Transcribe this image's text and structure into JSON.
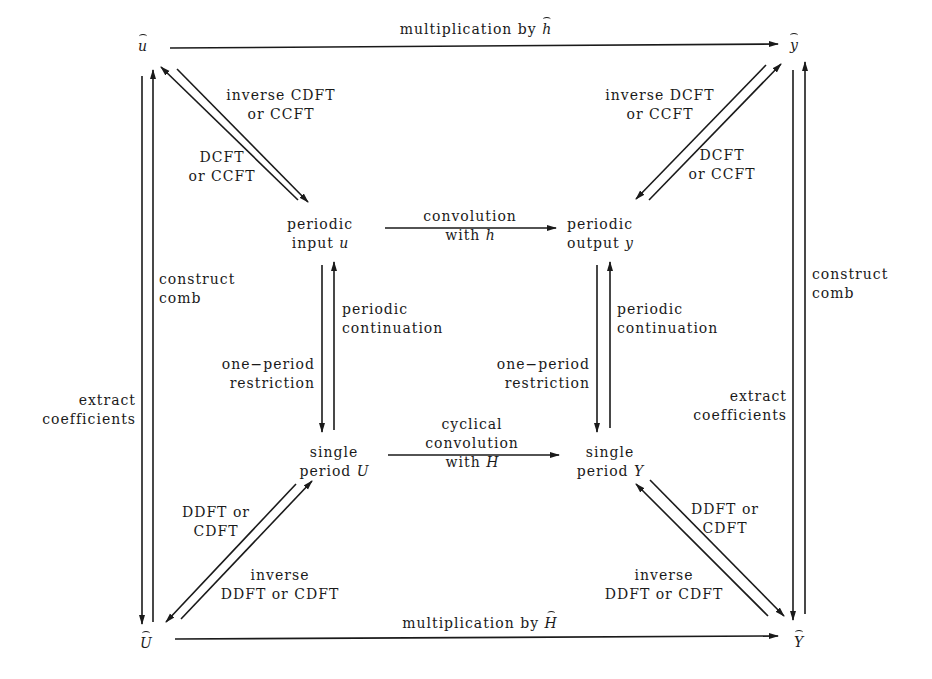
{
  "diagram": {
    "type": "commutative-diagram",
    "colors": {
      "ink": "#1a1a1a",
      "background": "#ffffff"
    },
    "nodes": {
      "u_hat": {
        "symbol": "u",
        "hat": true
      },
      "y_hat": {
        "symbol": "y",
        "hat": true
      },
      "U_hat": {
        "symbol": "U",
        "hat": true
      },
      "Y_hat": {
        "symbol": "Y",
        "hat": true
      },
      "periodic_input": {
        "line1": "periodic",
        "line2": "input",
        "var": "u"
      },
      "periodic_output": {
        "line1": "periodic",
        "line2": "output",
        "var": "y"
      },
      "single_U": {
        "line1": "single",
        "line2": "period",
        "var": "U"
      },
      "single_Y": {
        "line1": "single",
        "line2": "period",
        "var": "Y"
      }
    },
    "edges": {
      "top": {
        "text": "multiplication by",
        "var": "h",
        "from": "u_hat",
        "to": "y_hat"
      },
      "bottom": {
        "text": "multiplication by",
        "var": "H",
        "from": "U_hat",
        "to": "Y_hat"
      },
      "middle_top": {
        "line1": "convolution",
        "line2": "with",
        "var": "h",
        "from": "periodic_input",
        "to": "periodic_output"
      },
      "middle_bottom": {
        "line1": "cyclical",
        "line2": "convolution",
        "line3": "with",
        "var": "H",
        "from": "single_U",
        "to": "single_Y"
      },
      "tl_diag_up": {
        "line1": "inverse CDFT",
        "line2": "or CCFT",
        "from": "periodic_input",
        "to": "u_hat"
      },
      "tl_diag_down": {
        "line1": "DCFT",
        "line2": "or CCFT",
        "from": "u_hat",
        "to": "periodic_input"
      },
      "tr_diag_up": {
        "line1": "DCFT",
        "line2": "or CCFT",
        "from": "periodic_output",
        "to": "y_hat"
      },
      "tr_diag_down": {
        "line1": "inverse DCFT",
        "line2": "or CCFT",
        "from": "y_hat",
        "to": "periodic_output"
      },
      "bl_diag_up": {
        "line1": "DDFT or",
        "line2": "CDFT",
        "from": "U_hat",
        "to": "single_U"
      },
      "bl_diag_down": {
        "line1": "inverse",
        "line2": "DDFT or CDFT",
        "from": "single_U",
        "to": "U_hat"
      },
      "br_diag_up": {
        "line1": "DDFT or",
        "line2": "CDFT",
        "from": "Y_hat",
        "to": "single_Y"
      },
      "br_diag_down": {
        "line1": "inverse",
        "line2": "DDFT or CDFT",
        "from": "single_Y",
        "to": "Y_hat"
      },
      "left_inner_up": {
        "line1": "periodic",
        "line2": "continuation",
        "from": "single_U",
        "to": "periodic_input"
      },
      "left_inner_down": {
        "line1": "one−period",
        "line2": "restriction",
        "from": "periodic_input",
        "to": "single_U"
      },
      "right_inner_up": {
        "line1": "periodic",
        "line2": "continuation",
        "from": "single_Y",
        "to": "periodic_output"
      },
      "right_inner_down": {
        "line1": "one−period",
        "line2": "restriction",
        "from": "periodic_output",
        "to": "single_Y"
      },
      "left_outer_up": {
        "line1": "construct",
        "line2": "comb",
        "from": "U_hat",
        "to": "u_hat"
      },
      "left_outer_down": {
        "line1": "extract",
        "line2": "coefficients",
        "from": "u_hat",
        "to": "U_hat"
      },
      "right_outer_up": {
        "line1": "construct",
        "line2": "comb",
        "from": "Y_hat",
        "to": "y_hat"
      },
      "right_outer_down": {
        "line1": "extract",
        "line2": "coefficients",
        "from": "y_hat",
        "to": "Y_hat"
      }
    }
  }
}
